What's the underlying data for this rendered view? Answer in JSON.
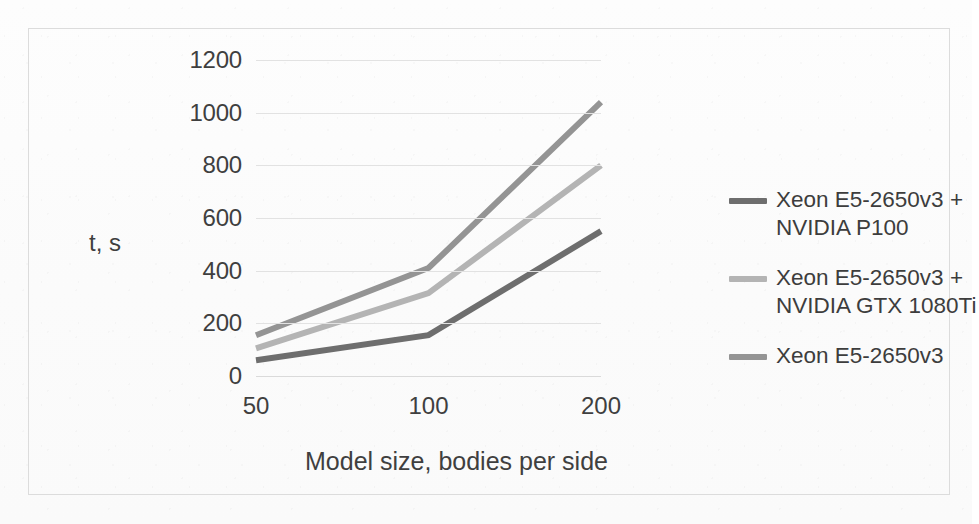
{
  "chart_data": {
    "type": "line",
    "title": "",
    "subtitle": "",
    "xlabel": "Model size, bodies per side",
    "ylabel": "t, s",
    "categories": [
      "50",
      "100",
      "200"
    ],
    "x": [
      50,
      100,
      200
    ],
    "ylim": [
      0,
      1200
    ],
    "yticks": [
      0,
      200,
      400,
      600,
      800,
      1000,
      1200
    ],
    "ytick_labels": [
      "0",
      "200",
      "400",
      "600",
      "800",
      "1000",
      "1200"
    ],
    "grid": true,
    "legend_position": "right",
    "series": [
      {
        "name": "Xeon E5-2650v3 +\nNVIDIA P100",
        "values": [
          60,
          155,
          550
        ],
        "color": "#6e6e6e"
      },
      {
        "name": "Xeon E5-2650v3 +\nNVIDIA GTX 1080Ti",
        "values": [
          105,
          315,
          800
        ],
        "color": "#b4b4b4"
      },
      {
        "name": "Xeon E5-2650v3",
        "values": [
          155,
          410,
          1040
        ],
        "color": "#949494"
      }
    ]
  },
  "axes": {
    "y_title": "t, s",
    "x_title": "Model size, bodies per side",
    "y_ticks": [
      "1200",
      "1000",
      "800",
      "600",
      "400",
      "200",
      "0"
    ],
    "x_ticks": [
      "50",
      "100",
      "200"
    ]
  },
  "legend": {
    "items": [
      {
        "label": "Xeon E5-2650v3 +\nNVIDIA P100",
        "color": "#6e6e6e"
      },
      {
        "label": "Xeon E5-2650v3 +\nNVIDIA GTX 1080Ti",
        "color": "#b4b4b4"
      },
      {
        "label": "Xeon E5-2650v3",
        "color": "#949494"
      }
    ]
  },
  "colors": {
    "grid": "#e2e2e2",
    "frame": "#dcdcdc",
    "text": "#3f3f3f",
    "background": "#fbfbfb"
  }
}
